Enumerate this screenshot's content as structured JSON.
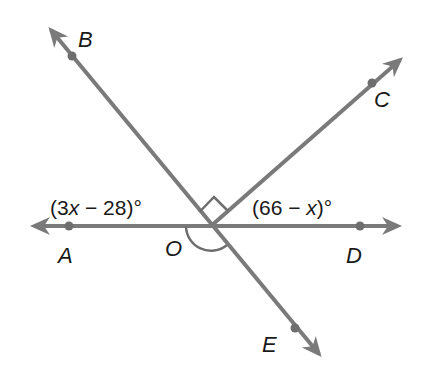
{
  "diagram": {
    "type": "geometry-lines-angles",
    "center_point": {
      "label": "O",
      "x": 211,
      "y": 226
    },
    "lines": [
      {
        "name": "line-AD",
        "from": [
          30,
          226
        ],
        "to": [
          402,
          226
        ],
        "arrows": "both"
      },
      {
        "name": "line-BE",
        "from": [
          48,
          26
        ],
        "to": [
          322,
          358
        ],
        "arrows": "both"
      },
      {
        "name": "ray-OC",
        "from": [
          211,
          226
        ],
        "to": [
          404,
          56
        ],
        "arrows": "end"
      }
    ],
    "points": [
      {
        "label": "A",
        "x": 69,
        "y": 226,
        "label_x": 58,
        "label_y": 263
      },
      {
        "label": "B",
        "x": 72,
        "y": 56,
        "label_x": 78,
        "label_y": 47
      },
      {
        "label": "C",
        "x": 372,
        "y": 83,
        "label_x": 374,
        "label_y": 107
      },
      {
        "label": "D",
        "x": 360,
        "y": 226,
        "label_x": 346,
        "label_y": 263
      },
      {
        "label": "E",
        "x": 295,
        "y": 328,
        "label_x": 262,
        "label_y": 352
      },
      {
        "label": "O",
        "x": 211,
        "y": 226,
        "label_x": 165,
        "label_y": 256
      }
    ],
    "angle_labels": {
      "left": {
        "prefix": "(3",
        "var": "x",
        "suffix": " − 28)°"
      },
      "right": {
        "prefix": "(66 − ",
        "var": "x",
        "suffix": ")°"
      }
    },
    "marks": {
      "right_angle": "between OB and OC",
      "arc": "angle below O between OA and OE"
    },
    "colors": {
      "line": "#7a7a7a",
      "text": "#1a1a1a",
      "mark": "#6e6e6e"
    }
  }
}
